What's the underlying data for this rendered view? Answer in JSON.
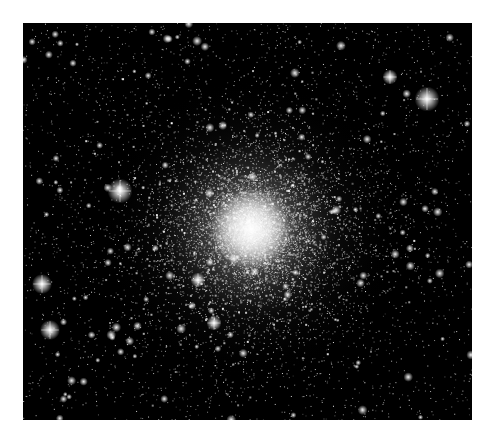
{
  "image": {
    "subject": "globular star cluster",
    "alt": "Dense globular star cluster on a black starfield with a bright white core",
    "background_color": "#000000",
    "border_color": "#ffffff",
    "frame": {
      "x": 23,
      "y": 23,
      "width": 449,
      "height": 397
    },
    "core": {
      "x": 228,
      "y": 206,
      "radius": 150,
      "color": "#ffffff"
    },
    "bright_stars": [
      {
        "x": 404,
        "y": 76,
        "r": 5
      },
      {
        "x": 19,
        "y": 261,
        "r": 4
      },
      {
        "x": 27,
        "y": 307,
        "r": 4
      },
      {
        "x": 97,
        "y": 168,
        "r": 5
      },
      {
        "x": 367,
        "y": 54,
        "r": 3
      },
      {
        "x": 191,
        "y": 300,
        "r": 3
      },
      {
        "x": 175,
        "y": 257,
        "r": 3
      }
    ]
  }
}
